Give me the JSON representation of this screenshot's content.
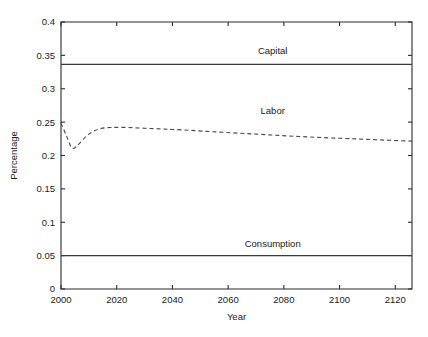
{
  "chart_data": {
    "type": "line",
    "title": "",
    "xlabel": "Year",
    "ylabel": "Percentage",
    "xlim": [
      2000,
      2126
    ],
    "ylim": [
      0,
      0.4
    ],
    "grid": false,
    "legend": "inline-annotations",
    "xticks": [
      "2000",
      "2020",
      "2040",
      "2060",
      "2080",
      "2100",
      "2120"
    ],
    "xtick_values": [
      2000,
      2020,
      2040,
      2060,
      2080,
      2100,
      2120
    ],
    "yticks": [
      "0",
      "0.05",
      "0.1",
      "0.15",
      "0.2",
      "0.25",
      "0.3",
      "0.35",
      "0.4"
    ],
    "ytick_values": [
      0,
      0.05,
      0.1,
      0.15,
      0.2,
      0.25,
      0.3,
      0.35,
      0.4
    ],
    "series": [
      {
        "name": "Capital",
        "style": "solid",
        "color": "#3a3a3a",
        "label_x": 2076,
        "label_y": 0.352,
        "x": [
          2000,
          2126
        ],
        "values": [
          0.3365,
          0.3365
        ]
      },
      {
        "name": "Labor",
        "style": "dashed",
        "color": "#4a4a4a",
        "label_x": 2076,
        "label_y": 0.262,
        "x": [
          2000,
          2002,
          2004,
          2006,
          2008,
          2010,
          2012,
          2014,
          2016,
          2018,
          2020,
          2024,
          2028,
          2032,
          2036,
          2040,
          2046,
          2052,
          2058,
          2064,
          2070,
          2076,
          2082,
          2088,
          2094,
          2100,
          2106,
          2112,
          2118,
          2126
        ],
        "values": [
          0.2485,
          0.229,
          0.211,
          0.2155,
          0.2245,
          0.232,
          0.237,
          0.24,
          0.2415,
          0.242,
          0.2422,
          0.242,
          0.2412,
          0.2405,
          0.2398,
          0.239,
          0.2378,
          0.2362,
          0.2348,
          0.2334,
          0.232,
          0.2306,
          0.2292,
          0.228,
          0.2268,
          0.2258,
          0.2248,
          0.2238,
          0.2228,
          0.2215
        ]
      },
      {
        "name": "Consumption",
        "style": "solid",
        "color": "#3a3a3a",
        "label_x": 2076,
        "label_y": 0.0625,
        "x": [
          2000,
          2126
        ],
        "values": [
          0.05,
          0.05
        ]
      }
    ]
  },
  "axis": {
    "y_title": "Percentage",
    "x_title": "Year"
  },
  "labels": {
    "capital": "Capital",
    "labor": "Labor",
    "consumption": "Consumption"
  }
}
